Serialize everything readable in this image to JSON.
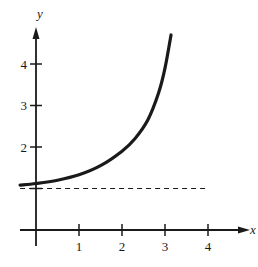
{
  "chart_data": {
    "type": "line",
    "title": "",
    "xlabel": "x",
    "ylabel": "y",
    "xlim": [
      -0.4,
      4.9
    ],
    "ylim": [
      0,
      4.8
    ],
    "x_ticks": [
      1,
      2,
      3,
      4
    ],
    "y_ticks": [
      2,
      3,
      4
    ],
    "x_tick_labels": [
      "1",
      "2",
      "3",
      "4"
    ],
    "y_tick_labels": [
      "2",
      "3",
      "4"
    ],
    "grid": false,
    "legend": null,
    "series": [
      {
        "name": "curve",
        "style": "solid",
        "x": [
          -0.37,
          0,
          0.5,
          1.0,
          1.5,
          2.0,
          2.3,
          2.6,
          2.85,
          3.0,
          3.14
        ],
        "y": [
          1.08,
          1.12,
          1.2,
          1.33,
          1.55,
          1.9,
          2.2,
          2.65,
          3.3,
          3.9,
          4.7
        ]
      },
      {
        "name": "asymptote",
        "style": "dashed",
        "x": [
          -0.37,
          4.0
        ],
        "y": [
          1,
          1
        ]
      }
    ],
    "annotations": []
  },
  "colors": {
    "ink": "#1a1a1a",
    "background": "#ffffff"
  }
}
